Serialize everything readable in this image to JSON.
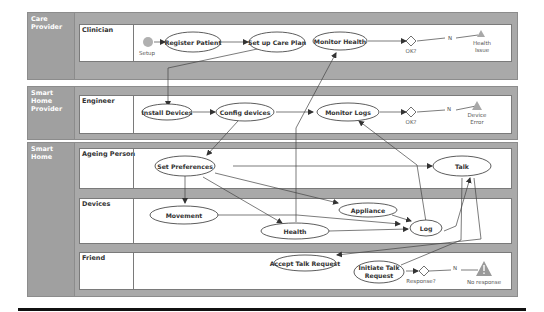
{
  "pools": [
    {
      "label": "Care Provider",
      "lanes": [
        {
          "label": "Clinician"
        }
      ]
    },
    {
      "label": "Smart Home Provider",
      "lanes": [
        {
          "label": "Engineer"
        }
      ]
    },
    {
      "label": "Smart Home",
      "lanes": [
        {
          "label": "Ageing Person"
        },
        {
          "label": "Devices"
        },
        {
          "label": "Friend"
        }
      ]
    }
  ],
  "nodes": {
    "setup": "Setup",
    "register_patient": "Register Patient",
    "set_up_care_plan": "Set up Care Plan",
    "monitor_health": "Monitor Health",
    "ok1": "OK?",
    "n1": "N",
    "health_issue_1": "Health",
    "health_issue_2": "Issue",
    "install_devices": "Install Devices",
    "config_devices": "Config devices",
    "monitor_logs": "Monitor Logs",
    "ok2": "OK?",
    "n2": "N",
    "device_error_1": "Device",
    "device_error_2": "Error",
    "set_preferences": "Set Preferences",
    "talk": "Talk",
    "movement": "Movement",
    "appliance": "Appliance",
    "health": "Health",
    "log": "Log",
    "accept_talk_request": "Accept Talk Request",
    "initiate_talk_request_1": "Initiate Talk",
    "initiate_talk_request_2": "Request",
    "response": "Response?",
    "n3": "N",
    "no_response": "No response"
  },
  "colors": {
    "pool_bg": "#a9a9a9",
    "lane_bg": "#ffffff",
    "start_node": "#b0b0b0",
    "warning_triangle": "#9a9a9a"
  }
}
